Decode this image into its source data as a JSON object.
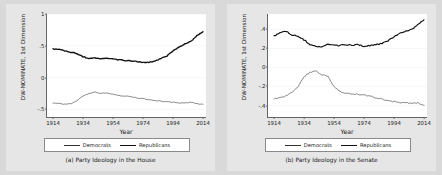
{
  "figure": {
    "background_color": "#d8d8d8",
    "panel_background_color": "#e6e6e6",
    "plot_background_color": "#ffffff"
  },
  "panels": [
    {
      "id": "house",
      "caption": "(a) Party Ideology in the House",
      "ylabel": "DW-NOMINATE, 1st Dimension",
      "xlabel": "Year",
      "legend": {
        "democrats": "Democrats",
        "republicans": "Republicans"
      }
    },
    {
      "id": "senate",
      "caption": "(b) Party Ideology in the Senate",
      "ylabel": "DW-NOMINATE, 1st Dimension",
      "xlabel": "Year",
      "legend": {
        "democrats": "Democrats",
        "republicans": "Republicans"
      }
    }
  ],
  "chart_data": [
    {
      "type": "line",
      "id": "house",
      "title": "(a) Party Ideology in the House",
      "xlabel": "Year",
      "ylabel": "DW-NOMINATE, 1st Dimension",
      "xlim": [
        1910,
        2016
      ],
      "ylim": [
        -0.62,
        1.0
      ],
      "xticks": [
        1914,
        1934,
        1954,
        1974,
        1994,
        2014
      ],
      "xticklabels": [
        "1914",
        "1934",
        "1954",
        "1974",
        "1994",
        "2014"
      ],
      "yticks": [
        1,
        0.5,
        0,
        -0.5
      ],
      "yticklabels": [
        "1",
        ".5",
        "0",
        "-.5"
      ],
      "grid": false,
      "legend_position": "below-axes",
      "series": [
        {
          "name": "Republicans",
          "color": "#111111",
          "width": 1.4,
          "x": [
            1914,
            1918,
            1922,
            1926,
            1930,
            1934,
            1938,
            1942,
            1946,
            1950,
            1954,
            1958,
            1962,
            1966,
            1970,
            1974,
            1978,
            1982,
            1986,
            1990,
            1994,
            1998,
            2002,
            2006,
            2010,
            2014
          ],
          "values": [
            0.45,
            0.44,
            0.42,
            0.4,
            0.38,
            0.33,
            0.3,
            0.31,
            0.3,
            0.3,
            0.29,
            0.28,
            0.27,
            0.26,
            0.25,
            0.24,
            0.24,
            0.26,
            0.3,
            0.34,
            0.42,
            0.48,
            0.53,
            0.57,
            0.66,
            0.72
          ]
        },
        {
          "name": "Democrats",
          "color": "#333333",
          "width": 0.6,
          "x": [
            1914,
            1918,
            1922,
            1926,
            1930,
            1934,
            1938,
            1942,
            1946,
            1950,
            1954,
            1958,
            1962,
            1966,
            1970,
            1974,
            1978,
            1982,
            1986,
            1990,
            1994,
            1998,
            2002,
            2006,
            2010,
            2014
          ],
          "values": [
            -0.4,
            -0.41,
            -0.42,
            -0.41,
            -0.36,
            -0.29,
            -0.25,
            -0.23,
            -0.25,
            -0.24,
            -0.26,
            -0.28,
            -0.29,
            -0.3,
            -0.32,
            -0.33,
            -0.35,
            -0.36,
            -0.37,
            -0.38,
            -0.39,
            -0.4,
            -0.4,
            -0.39,
            -0.41,
            -0.42
          ]
        }
      ]
    },
    {
      "type": "line",
      "id": "senate",
      "title": "(b) Party Ideology in the Senate",
      "xlabel": "Year",
      "ylabel": "DW-NOMINATE, 1st Dimension",
      "xlim": [
        1910,
        2016
      ],
      "ylim": [
        -0.52,
        0.56
      ],
      "xticks": [
        1914,
        1934,
        1954,
        1974,
        1994,
        2014
      ],
      "xticklabels": [
        "1914",
        "1934",
        "1954",
        "1974",
        "1994",
        "2014"
      ],
      "yticks": [
        0.4,
        0.2,
        0,
        -0.2,
        -0.4
      ],
      "yticklabels": [
        ".4",
        ".2",
        "0",
        "-.2",
        "-.4"
      ],
      "grid": false,
      "legend_position": "below-axes",
      "series": [
        {
          "name": "Republicans",
          "color": "#111111",
          "width": 1.2,
          "x": [
            1914,
            1918,
            1922,
            1926,
            1930,
            1934,
            1938,
            1942,
            1946,
            1950,
            1954,
            1958,
            1962,
            1966,
            1970,
            1974,
            1978,
            1982,
            1986,
            1990,
            1994,
            1998,
            2002,
            2006,
            2010,
            2014
          ],
          "values": [
            0.33,
            0.36,
            0.38,
            0.34,
            0.33,
            0.29,
            0.24,
            0.22,
            0.22,
            0.24,
            0.23,
            0.23,
            0.24,
            0.23,
            0.24,
            0.22,
            0.23,
            0.24,
            0.25,
            0.28,
            0.32,
            0.36,
            0.38,
            0.4,
            0.45,
            0.5
          ]
        },
        {
          "name": "Democrats",
          "color": "#333333",
          "width": 0.6,
          "x": [
            1914,
            1918,
            1922,
            1926,
            1930,
            1934,
            1938,
            1942,
            1946,
            1950,
            1954,
            1958,
            1962,
            1966,
            1970,
            1974,
            1978,
            1982,
            1986,
            1990,
            1994,
            1998,
            2002,
            2006,
            2010,
            2014
          ],
          "values": [
            -0.33,
            -0.32,
            -0.3,
            -0.26,
            -0.2,
            -0.1,
            -0.05,
            -0.04,
            -0.08,
            -0.09,
            -0.2,
            -0.25,
            -0.27,
            -0.28,
            -0.28,
            -0.29,
            -0.3,
            -0.32,
            -0.33,
            -0.35,
            -0.36,
            -0.37,
            -0.37,
            -0.38,
            -0.37,
            -0.4
          ]
        }
      ]
    }
  ]
}
